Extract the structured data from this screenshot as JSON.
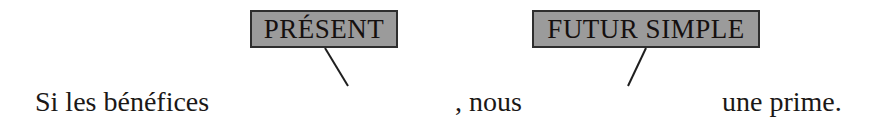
{
  "diagram": {
    "title_text": "Si les bénéfices augmentent , nous recevrons une prime.",
    "colors": {
      "shape_fill": "#9b9b9b",
      "shape_stroke": "#2b2b2b",
      "text": "#15100f",
      "background": "#ffffff",
      "connector": "#1f1f1f"
    }
  },
  "tense_labels": [
    {
      "id": "present",
      "label": "PRÉSENT",
      "target_verb": "augmentent"
    },
    {
      "id": "futur-simple",
      "label": "FUTUR SIMPLE",
      "target_verb": "recevrons"
    }
  ],
  "sentence": {
    "clause_start": "Si les bénéfices",
    "verb_1": "augmentent",
    "middle": ", nous",
    "verb_2": "recevrons",
    "clause_end": "une prime."
  },
  "connectors": [
    {
      "id": "connector-present-to-augmentent",
      "from_label": "PRÉSENT",
      "to_verb": "augmentent"
    },
    {
      "id": "connector-futur-to-recevrons",
      "from_label": "FUTUR SIMPLE",
      "to_verb": "recevrons"
    }
  ]
}
